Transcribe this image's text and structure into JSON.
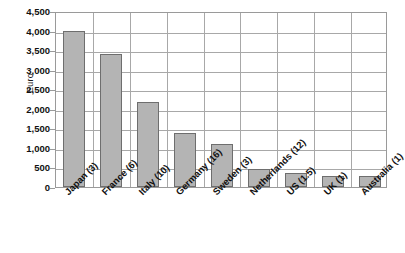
{
  "chart_data": {
    "type": "bar",
    "title": "",
    "xlabel": "",
    "ylabel": "Euro",
    "ylim": [
      0,
      4500
    ],
    "ytick_step": 500,
    "grid": true,
    "legend": false,
    "categories": [
      "Japan (3)",
      "France (6)",
      "Italy (10)",
      "Germany (16)",
      "Sweden (3)",
      "Netherlands (12)",
      "US (1.5)",
      "UK (1)",
      "Australia (1)"
    ],
    "values": [
      4000,
      3400,
      2170,
      1390,
      1090,
      470,
      370,
      290,
      280
    ],
    "ytick_labels": [
      "4,500",
      "4,000",
      "3,500",
      "3,000",
      "2,500",
      "2,000",
      "1,500",
      "1,000",
      "500",
      "0"
    ],
    "ytick_values": [
      4500,
      4000,
      3500,
      3000,
      2500,
      2000,
      1500,
      1000,
      500,
      0
    ],
    "bar_fill_color": "#b4b4b4",
    "bar_border_color": "#6e6e6e",
    "gridline_color": "#a8a8a8",
    "axis_color": "#9a9a9a",
    "background_color": "#ffffff"
  }
}
